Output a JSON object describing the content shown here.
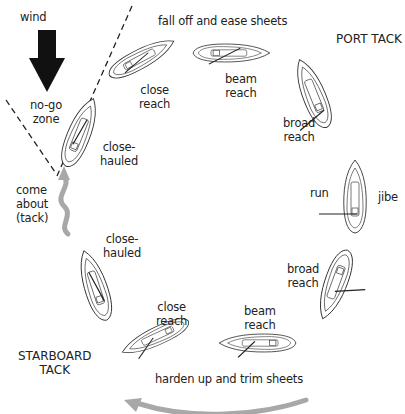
{
  "diagram": {
    "labels": {
      "wind": "wind",
      "no_go_zone": "no-go\nzone",
      "fall_off": "fall off and ease sheets",
      "port_tack": "PORT TACK",
      "starboard_tack": "STARBOARD\nTACK",
      "harden_up": "harden up and trim sheets",
      "come_about": "come\nabout\n(tack)",
      "jibe": "jibe"
    },
    "port_boats": [
      {
        "label": "close-\nhauled"
      },
      {
        "label": "close\nreach"
      },
      {
        "label": "beam\nreach"
      },
      {
        "label": "broad\nreach"
      },
      {
        "label": "run"
      }
    ],
    "starboard_boats": [
      {
        "label": "broad\nreach"
      },
      {
        "label": "beam\nreach"
      },
      {
        "label": "close\nreach"
      },
      {
        "label": "close-\nhauled"
      }
    ],
    "colors": {
      "arrow_gray": "#a8a8a8",
      "wind_arrow": "#111111",
      "line": "#333333"
    }
  }
}
